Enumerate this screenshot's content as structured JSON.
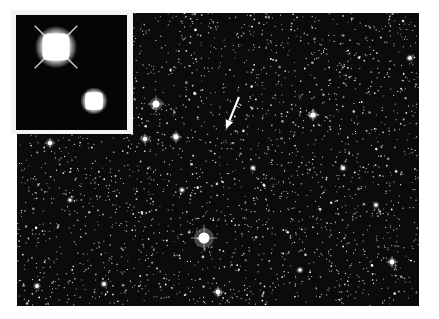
{
  "figure": {
    "caption_visible": "",
    "colors": {
      "page_background": "#ffffff",
      "field_background": "#0b0b0b",
      "inset_frame": "#f4f4f4",
      "inset_background": "#050505",
      "star": "#ffffff",
      "arrow": "#ffffff"
    },
    "field": {
      "x": 17,
      "y": 13,
      "width": 402,
      "height": 293,
      "star_count": 2600,
      "seed": 7
    },
    "bright_stars": [
      {
        "x": 204,
        "y": 238,
        "r": 5.5
      },
      {
        "x": 156,
        "y": 104,
        "r": 3.5
      },
      {
        "x": 176,
        "y": 137,
        "r": 2.5
      },
      {
        "x": 145,
        "y": 139,
        "r": 2.2
      },
      {
        "x": 313,
        "y": 115,
        "r": 2.6
      },
      {
        "x": 50,
        "y": 143,
        "r": 2.2
      },
      {
        "x": 218,
        "y": 292,
        "r": 2.4
      },
      {
        "x": 392,
        "y": 262,
        "r": 2.4
      },
      {
        "x": 410,
        "y": 58,
        "r": 2.0
      },
      {
        "x": 37,
        "y": 286,
        "r": 2.0
      },
      {
        "x": 343,
        "y": 168,
        "r": 2.0
      },
      {
        "x": 104,
        "y": 284,
        "r": 2.0
      },
      {
        "x": 253,
        "y": 168,
        "r": 1.8
      },
      {
        "x": 376,
        "y": 205,
        "r": 1.8
      },
      {
        "x": 182,
        "y": 190,
        "r": 1.8
      },
      {
        "x": 70,
        "y": 200,
        "r": 1.6
      },
      {
        "x": 300,
        "y": 270,
        "r": 1.8
      }
    ],
    "inset": {
      "sources": [
        {
          "name": "large-source",
          "cx": 40,
          "cy": 32,
          "r": 17,
          "spikes": true
        },
        {
          "name": "small-source",
          "cx": 78,
          "cy": 86,
          "r": 11,
          "spikes": false
        }
      ]
    },
    "arrow": {
      "tail_x": 239,
      "tail_y": 97,
      "head_x": 226,
      "head_y": 129
    }
  }
}
